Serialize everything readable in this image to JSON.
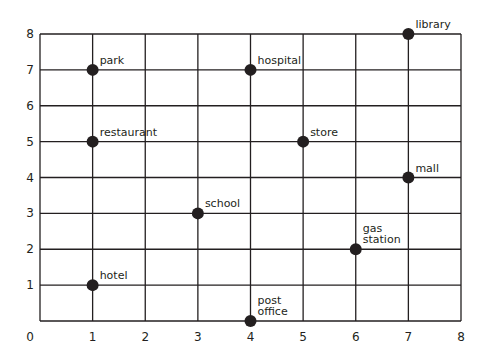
{
  "chart_data": {
    "type": "scatter",
    "title": "",
    "xlabel": "",
    "ylabel": "",
    "xlim": [
      0,
      8
    ],
    "ylim": [
      0,
      8
    ],
    "grid": true,
    "legend": null,
    "x_ticks": [
      "0",
      "1",
      "2",
      "3",
      "4",
      "5",
      "6",
      "7",
      "8"
    ],
    "y_ticks": [
      "1",
      "2",
      "3",
      "4",
      "5",
      "6",
      "7",
      "8"
    ],
    "points": [
      {
        "label": "park",
        "label_lines": [
          "park"
        ],
        "x": 1,
        "y": 7
      },
      {
        "label": "hospital",
        "label_lines": [
          "hospital"
        ],
        "x": 4,
        "y": 7
      },
      {
        "label": "library",
        "label_lines": [
          "library"
        ],
        "x": 7,
        "y": 8
      },
      {
        "label": "restaurant",
        "label_lines": [
          "restaurant"
        ],
        "x": 1,
        "y": 5
      },
      {
        "label": "store",
        "label_lines": [
          "store"
        ],
        "x": 5,
        "y": 5
      },
      {
        "label": "mall",
        "label_lines": [
          "mall"
        ],
        "x": 7,
        "y": 4
      },
      {
        "label": "school",
        "label_lines": [
          "school"
        ],
        "x": 3,
        "y": 3
      },
      {
        "label": "gas station",
        "label_lines": [
          "gas",
          "station"
        ],
        "x": 6,
        "y": 2
      },
      {
        "label": "hotel",
        "label_lines": [
          "hotel"
        ],
        "x": 1,
        "y": 1
      },
      {
        "label": "post office",
        "label_lines": [
          "post",
          "office"
        ],
        "x": 4,
        "y": 0
      }
    ]
  },
  "colors": {
    "ink": "#231f20",
    "background": "#ffffff"
  }
}
